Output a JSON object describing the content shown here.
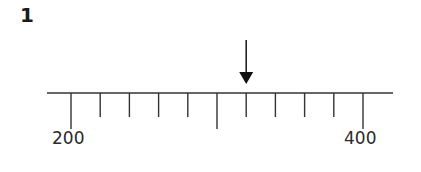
{
  "question": {
    "number": "1"
  },
  "number_line": {
    "start_value": 200,
    "end_value": 400,
    "tick_interval": 20,
    "labels": [
      {
        "value": "200",
        "x": 70
      },
      {
        "value": "400",
        "x": 362
      }
    ],
    "long_ticks": [
      200,
      300,
      400
    ],
    "arrow_points_to": 320,
    "line_color": "#333333"
  }
}
